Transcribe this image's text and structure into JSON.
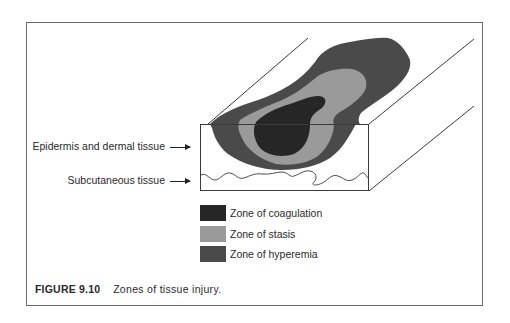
{
  "figure": {
    "number": "FIGURE 9.10",
    "caption": "Zones of tissue injury."
  },
  "labels": {
    "epidermis": "Epidermis and dermal tissue",
    "subcutaneous": "Subcutaneous tissue"
  },
  "legend": [
    {
      "label": "Zone of coagulation",
      "color": "#262626"
    },
    {
      "label": "Zone of stasis",
      "color": "#9a9a9a"
    },
    {
      "label": "Zone of hyperemia",
      "color": "#4a4a4a"
    }
  ],
  "colors": {
    "coagulation": "#262626",
    "stasis": "#9a9a9a",
    "hyperemia": "#4a4a4a",
    "line": "#3a3a3a",
    "frame": "#6a6a6a"
  }
}
